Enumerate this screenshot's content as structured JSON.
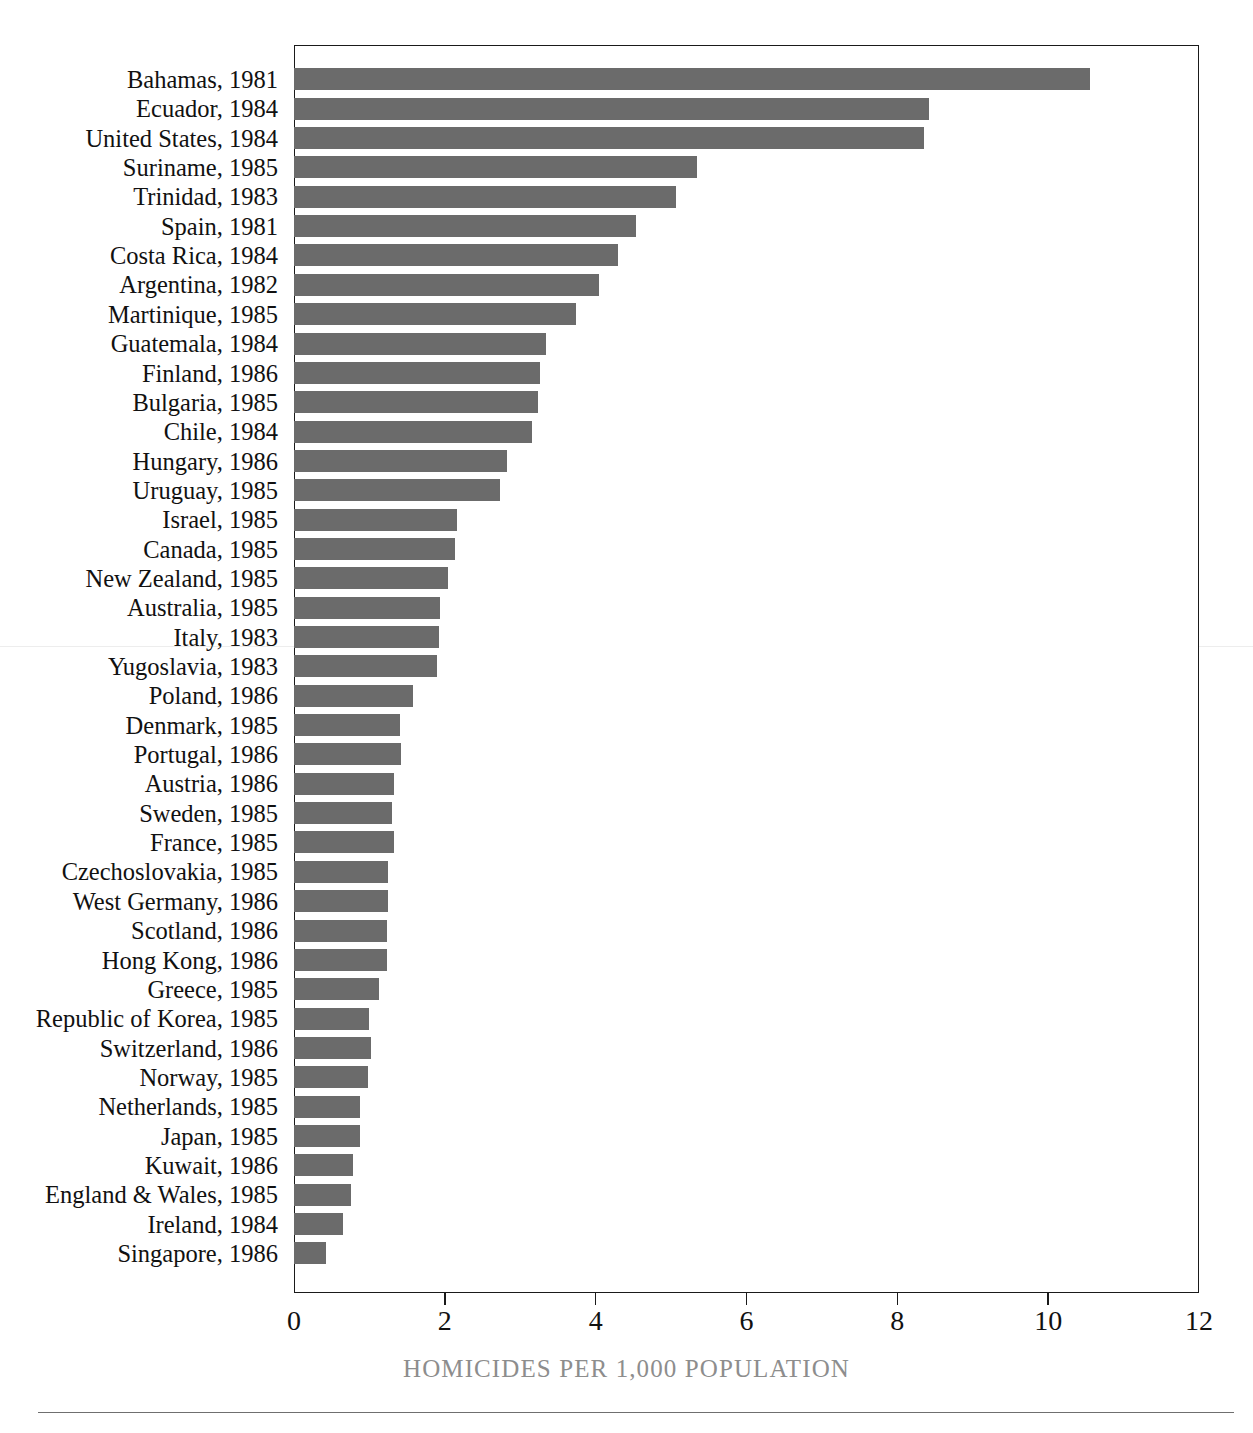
{
  "figure": {
    "top_clip_text": "",
    "bar_color": "#6b6b6b",
    "axis_color": "#1a1a1a",
    "label_color": "#111111",
    "axis_title_color": "#8d8d8d"
  },
  "chart_data": {
    "type": "bar",
    "orientation": "horizontal",
    "title": "",
    "xlabel": "HOMICIDES PER 1,000 POPULATION",
    "ylabel": "",
    "xlim": [
      0,
      12
    ],
    "xticks": [
      0,
      2,
      4,
      6,
      8,
      10,
      12
    ],
    "xtick_labels": [
      "0",
      "2",
      "4",
      "6",
      "8",
      "10",
      "12"
    ],
    "grid": false,
    "legend": null,
    "categories": [
      "Bahamas, 1981",
      "Ecuador, 1984",
      "United States, 1984",
      "Suriname, 1985",
      "Trinidad, 1983",
      "Spain, 1981",
      "Costa Rica, 1984",
      "Argentina, 1982",
      "Martinique, 1985",
      "Guatemala, 1984",
      "Finland, 1986",
      "Bulgaria, 1985",
      "Chile, 1984",
      "Hungary, 1986",
      "Uruguay, 1985",
      "Israel, 1985",
      "Canada, 1985",
      "New Zealand, 1985",
      "Australia, 1985",
      "Italy, 1983",
      "Yugoslavia, 1983",
      "Poland, 1986",
      "Denmark, 1985",
      "Portugal, 1986",
      "Austria, 1986",
      "Sweden, 1985",
      "France, 1985",
      "Czechoslovakia, 1985",
      "West Germany, 1986",
      "Scotland, 1986",
      "Hong Kong, 1986",
      "Greece, 1985",
      "Republic of Korea, 1985",
      "Switzerland, 1986",
      "Norway, 1985",
      "Netherlands, 1985",
      "Japan, 1985",
      "Kuwait, 1986",
      "England & Wales, 1985",
      "Ireland, 1984",
      "Singapore, 1986"
    ],
    "values": [
      10.55,
      8.42,
      8.36,
      5.35,
      5.07,
      4.53,
      4.3,
      4.05,
      3.74,
      3.34,
      3.26,
      3.23,
      3.15,
      2.83,
      2.73,
      2.16,
      2.13,
      2.04,
      1.93,
      1.92,
      1.9,
      1.58,
      1.41,
      1.42,
      1.33,
      1.3,
      1.33,
      1.25,
      1.25,
      1.23,
      1.23,
      1.13,
      1.0,
      1.02,
      0.98,
      0.88,
      0.88,
      0.78,
      0.76,
      0.65,
      0.42
    ]
  }
}
